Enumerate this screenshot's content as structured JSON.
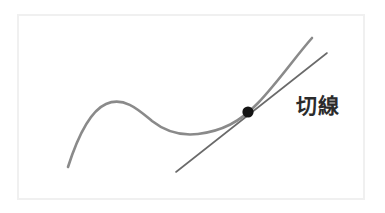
{
  "figure": {
    "title": "切線",
    "width": 385,
    "height": 213,
    "background_color": "#ffffff"
  },
  "frame": {
    "name": "border-frame",
    "x": 18,
    "y": 15,
    "width": 346,
    "height": 184,
    "stroke_color": "#f0f0f0"
  },
  "label": {
    "text": "切線",
    "meaning": "tangent line",
    "x": 296,
    "y": 107,
    "color": "#2b2b2b",
    "font_size": 21
  },
  "chart_data": {
    "type": "line",
    "title": "切線",
    "xlabel": "",
    "ylabel": "",
    "grid": false,
    "legend": "none",
    "axis_visible": false,
    "xlim": [
      18,
      364
    ],
    "ylim": [
      199,
      15
    ],
    "series": [
      {
        "name": "curve",
        "role": "function-curve",
        "color": "#8a8a8a",
        "stroke_width": 2.6,
        "path": "M 68 167 C 76 142, 88 112, 106 104 C 124 96, 139 110, 152 121 C 166 132, 181 136, 198 134 C 222 131, 240 122, 258 103 C 278 82, 296 56, 312 38",
        "key_points": [
          {
            "name": "left-endpoint",
            "x": 68,
            "y": 167
          },
          {
            "name": "local-maximum",
            "x": 118,
            "y": 104
          },
          {
            "name": "inflection-descending",
            "x": 152,
            "y": 121
          },
          {
            "name": "local-minimum",
            "x": 200,
            "y": 134
          },
          {
            "name": "tangency-point",
            "x": 248,
            "y": 112
          },
          {
            "name": "right-endpoint",
            "x": 312,
            "y": 38
          }
        ]
      },
      {
        "name": "tangent",
        "role": "tangent-line",
        "color": "#6a6a6a",
        "stroke_width": 1.6,
        "x1": 176,
        "y1": 172,
        "x2": 327,
        "y2": 53,
        "slope": -0.788
      }
    ],
    "annotations": [
      {
        "name": "tangency-dot",
        "type": "point-marker",
        "x": 248,
        "y": 112,
        "radius": 5.6,
        "color": "#141414"
      },
      {
        "name": "tangent-label",
        "type": "text",
        "text": "切線",
        "x": 296,
        "y": 107
      }
    ]
  }
}
